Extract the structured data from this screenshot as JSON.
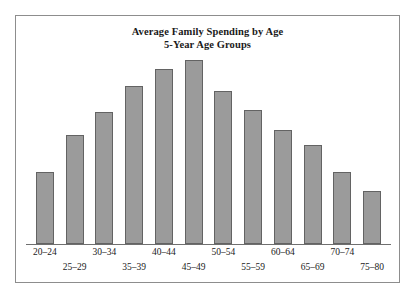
{
  "chart_data": {
    "type": "bar",
    "title": "Average Family Spending by Age",
    "subtitle": "5-Year Age Groups",
    "xlabel": "",
    "ylabel": "",
    "grid": false,
    "legend": false,
    "axis": {
      "baseline_visible": true,
      "y_axis_visible": false,
      "y_ticks": []
    },
    "categories": [
      "20–24",
      "25–29",
      "30–34",
      "35–39",
      "40–44",
      "45–49",
      "50–54",
      "55–59",
      "60–64",
      "65–69",
      "70–74",
      "75–80"
    ],
    "values": [
      39,
      59,
      72,
      86,
      95,
      100,
      83,
      73,
      62,
      54,
      39,
      29
    ],
    "value_units": "relative height (percent of tallest bar)",
    "ylim": [
      0,
      100
    ],
    "bar_color": "#9b9b9b",
    "bar_border_color": "#636363",
    "frame_color": "#8d8d8d",
    "background_color": "#ffffff",
    "label_layout": "alternating two rows, odd groups on upper row, even groups on lower row"
  }
}
